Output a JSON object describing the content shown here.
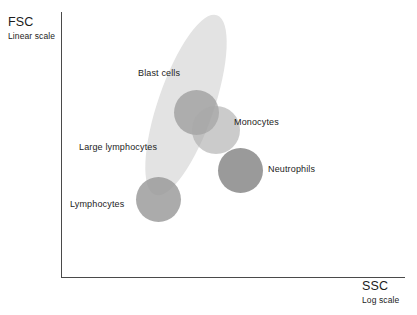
{
  "chart_data": {
    "type": "scatter",
    "title": "",
    "xlabel": "SSC",
    "ylabel": "FSC",
    "xlabel_sub": "Log scale",
    "ylabel_sub": "Linear scale",
    "grid": false,
    "legend_position": "none",
    "axis_note": "Schematic flow-cytometry FSC vs SSC dot plot; axes are unlabeled with no tick values.",
    "populations": [
      {
        "name": "Blast cells",
        "label": "Blast cells",
        "shape": "ellipse",
        "cx": 186,
        "cy": 105,
        "rx": 28,
        "ry": 95,
        "rotation_deg": 19,
        "color": "#e3e3e3",
        "opacity": 1.0,
        "ssc": "low",
        "fsc": "high"
      },
      {
        "name": "Large lymphocytes",
        "label": "Large lymphocytes",
        "shape": "circle",
        "cx": 196,
        "cy": 112,
        "r": 22,
        "color": "#8c8c8c",
        "opacity": 0.62,
        "ssc": "low-intermediate",
        "fsc": "intermediate"
      },
      {
        "name": "Monocytes",
        "label": "Monocytes",
        "shape": "circle",
        "cx": 216,
        "cy": 130,
        "r": 24,
        "color": "#a8a8a8",
        "opacity": 0.6,
        "ssc": "intermediate",
        "fsc": "intermediate"
      },
      {
        "name": "Neutrophils",
        "label": "Neutrophils",
        "shape": "circle",
        "cx": 240,
        "cy": 170,
        "r": 22,
        "color": "#8c8c8c",
        "opacity": 0.88,
        "ssc": "high",
        "fsc": "intermediate-low"
      },
      {
        "name": "Lymphocytes",
        "label": "Lymphocytes",
        "shape": "circle",
        "cx": 158,
        "cy": 199,
        "r": 22,
        "color": "#969696",
        "opacity": 0.8,
        "ssc": "low",
        "fsc": "low"
      }
    ],
    "axes": {
      "x": {
        "origin_x": 61,
        "end_x": 405,
        "y": 277,
        "color": "#4a4a4a"
      },
      "y": {
        "origin_y": 277,
        "end_y": 12,
        "x": 61,
        "color": "#4a4a4a"
      }
    }
  },
  "axes": {
    "y": {
      "title": "FSC",
      "subtitle": "Linear scale"
    },
    "x": {
      "title": "SSC",
      "subtitle": "Log scale"
    }
  },
  "labels": {
    "blast_cells": "Blast cells",
    "large_lymphocytes": "Large lymphocytes",
    "monocytes": "Monocytes",
    "neutrophils": "Neutrophils",
    "lymphocytes": "Lymphocytes"
  },
  "colors": {
    "axis": "#4a4a4a",
    "text": "#1c1c1c",
    "background": "#ffffff",
    "blast_cells": "#e3e3e3",
    "large_lymphocytes": "#8c8c8c",
    "monocytes": "#a8a8a8",
    "neutrophils": "#8c8c8c",
    "lymphocytes": "#969696"
  }
}
